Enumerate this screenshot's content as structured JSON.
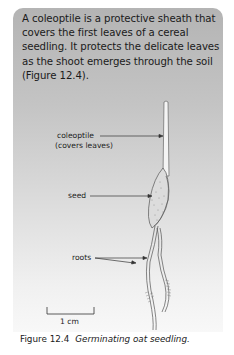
{
  "intro_text": "A coleoptile is a protective sheath that covers the first leaves of a cereal seedling. It protects the delicate leaves as the shoot emerges through the soil (Figure 12.4).",
  "figure": {
    "labels": {
      "coleoptile": "coleoptile",
      "coleoptile_note": "(covers leaves)",
      "seed": "seed",
      "roots": "roots",
      "scale": "1 cm"
    },
    "caption_number": "Figure 12.4",
    "caption_title": "Germinating oat seedling."
  },
  "colors": {
    "panel_top": "#b4b4b4",
    "panel_bottom": "#f8f8f8",
    "line": "#333333"
  }
}
